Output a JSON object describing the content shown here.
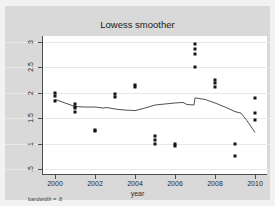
{
  "chart_data": {
    "type": "scatter",
    "title": "Lowess smoother",
    "xlabel": "year",
    "ylabel": "",
    "note": "bandwidth = .8",
    "xlim": [
      1999.4,
      2010.6
    ],
    "ylim": [
      0.4,
      3.12
    ],
    "grid": true,
    "legend_position": "none",
    "xticks": [
      "2000",
      "2002",
      "2004",
      "2006",
      "2008",
      "2010"
    ],
    "xtick_values": [
      2000,
      2002,
      2004,
      2006,
      2008,
      2010
    ],
    "yticks": [
      ".5",
      "1",
      "1.5",
      "2",
      "2.5",
      "3"
    ],
    "ytick_values": [
      0.5,
      1,
      1.5,
      2,
      2.5,
      3
    ],
    "series": [
      {
        "name": "observations",
        "type": "scatter",
        "marker": "square",
        "color": "#141414",
        "points": [
          [
            2000,
            2.0
          ],
          [
            2000,
            1.93
          ],
          [
            2000,
            1.84
          ],
          [
            2001,
            1.78
          ],
          [
            2001,
            1.73
          ],
          [
            2001,
            1.7
          ],
          [
            2001,
            1.62
          ],
          [
            2002,
            1.27
          ],
          [
            2002,
            1.24
          ],
          [
            2003,
            1.98
          ],
          [
            2003,
            1.91
          ],
          [
            2004,
            2.15
          ],
          [
            2004,
            2.11
          ],
          [
            2005,
            1.15
          ],
          [
            2005,
            1.07
          ],
          [
            2005,
            0.99
          ],
          [
            2006,
            0.99
          ],
          [
            2006,
            0.96
          ],
          [
            2007,
            2.97
          ],
          [
            2007,
            2.87
          ],
          [
            2007,
            2.76
          ],
          [
            2007,
            2.5
          ],
          [
            2008,
            2.26
          ],
          [
            2008,
            2.2
          ],
          [
            2008,
            2.11
          ],
          [
            2009,
            1.0
          ],
          [
            2009,
            0.76
          ],
          [
            2010,
            1.89
          ],
          [
            2010,
            1.6
          ],
          [
            2010,
            1.47
          ]
        ]
      },
      {
        "name": "lowess-smoother",
        "type": "line",
        "color": "#3d3d3d",
        "points": [
          [
            2000,
            1.87
          ],
          [
            2000.5,
            1.8
          ],
          [
            2001,
            1.73
          ],
          [
            2001.5,
            1.72
          ],
          [
            2002,
            1.72
          ],
          [
            2002.4,
            1.7
          ],
          [
            2002.6,
            1.71
          ],
          [
            2003,
            1.68
          ],
          [
            2003.5,
            1.66
          ],
          [
            2004,
            1.65
          ],
          [
            2004.5,
            1.7
          ],
          [
            2005,
            1.76
          ],
          [
            2005.5,
            1.78
          ],
          [
            2006,
            1.8
          ],
          [
            2006.4,
            1.81
          ],
          [
            2006.6,
            1.77
          ],
          [
            2006.95,
            1.76
          ],
          [
            2007,
            1.9
          ],
          [
            2007.5,
            1.87
          ],
          [
            2008,
            1.8
          ],
          [
            2008.5,
            1.72
          ],
          [
            2009,
            1.63
          ],
          [
            2009.3,
            1.6
          ],
          [
            2009.6,
            1.45
          ],
          [
            2010,
            1.22
          ]
        ]
      }
    ]
  }
}
